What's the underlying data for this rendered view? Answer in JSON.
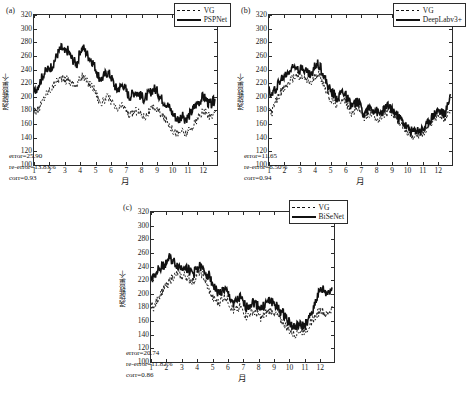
{
  "figure": {
    "background": "#ffffff",
    "series_color": "#111111"
  },
  "axis": {
    "xlabel": "月",
    "ylabel": "涡旋数量/个",
    "xticks": [
      "1",
      "2",
      "3",
      "4",
      "5",
      "6",
      "7",
      "8",
      "9",
      "10",
      "11",
      "12"
    ],
    "yticks": [
      "100",
      "120",
      "140",
      "160",
      "180",
      "200",
      "220",
      "240",
      "260",
      "280",
      "300",
      "320"
    ]
  },
  "panels": [
    {
      "tag": "(a)",
      "legend": [
        {
          "label": "VG",
          "style": "dashed"
        },
        {
          "label": "PSPNet",
          "style": "solid"
        }
      ],
      "stats": {
        "error": "error=25.90",
        "re_error": "re-error=13.83%",
        "corr": "corr=0.93"
      }
    },
    {
      "tag": "(b)",
      "legend": [
        {
          "label": "VG",
          "style": "dashed"
        },
        {
          "label": "DeepLabv3+",
          "style": "solid"
        }
      ],
      "stats": {
        "error": "error=11.65",
        "re_error": "re-error=6.50%",
        "corr": "corr=0.94"
      }
    },
    {
      "tag": "(c)",
      "legend": [
        {
          "label": "VG",
          "style": "dashed"
        },
        {
          "label": "BiSeNet",
          "style": "solid"
        }
      ],
      "stats": {
        "error": "error=20.74",
        "re_error": "re-error=11.82%",
        "corr": "corr=0.86"
      }
    }
  ],
  "chart_data": {
    "type": "line",
    "title": "",
    "xlabel": "月",
    "ylabel": "涡旋数量/个",
    "xlim": [
      1,
      12.9
    ],
    "ylim": [
      100,
      320
    ],
    "grid": false,
    "legend_position": "top-right",
    "panels": [
      {
        "tag": "(a)",
        "series": [
          {
            "name": "VG",
            "style": "dashed",
            "x": [
              1,
              1.2,
              1.4,
              1.6,
              1.8,
              2,
              2.2,
              2.4,
              2.6,
              2.8,
              3,
              3.2,
              3.4,
              3.6,
              3.8,
              4,
              4.2,
              4.4,
              4.6,
              4.8,
              5,
              5.2,
              5.4,
              5.6,
              5.8,
              6,
              6.2,
              6.4,
              6.6,
              6.8,
              7,
              7.2,
              7.4,
              7.6,
              7.8,
              8,
              8.2,
              8.4,
              8.6,
              8.8,
              9,
              9.2,
              9.4,
              9.6,
              9.8,
              10,
              10.2,
              10.4,
              10.6,
              10.8,
              11,
              11.2,
              11.4,
              11.6,
              11.8,
              12,
              12.2,
              12.4,
              12.6,
              12.8
            ],
            "values": [
              183,
              178,
              186,
              196,
              205,
              210,
              214,
              222,
              226,
              228,
              223,
              227,
              221,
              219,
              216,
              228,
              230,
              224,
              219,
              216,
              208,
              196,
              190,
              196,
              200,
              195,
              186,
              180,
              184,
              188,
              180,
              172,
              176,
              180,
              178,
              174,
              170,
              176,
              180,
              184,
              182,
              176,
              170,
              166,
              160,
              152,
              148,
              146,
              150,
              146,
              148,
              152,
              160,
              166,
              172,
              178,
              176,
              170,
              174,
              178
            ]
          },
          {
            "name": "PSPNet",
            "style": "solid",
            "x": [
              1,
              1.2,
              1.4,
              1.6,
              1.8,
              2,
              2.2,
              2.4,
              2.6,
              2.8,
              3,
              3.2,
              3.4,
              3.6,
              3.8,
              4,
              4.2,
              4.4,
              4.6,
              4.8,
              5,
              5.2,
              5.4,
              5.6,
              5.8,
              6,
              6.2,
              6.4,
              6.6,
              6.8,
              7,
              7.2,
              7.4,
              7.6,
              7.8,
              8,
              8.2,
              8.4,
              8.6,
              8.8,
              9,
              9.2,
              9.4,
              9.6,
              9.8,
              10,
              10.2,
              10.4,
              10.6,
              10.8,
              11,
              11.2,
              11.4,
              11.6,
              11.8,
              12,
              12.2,
              12.4,
              12.6,
              12.8
            ],
            "values": [
              206,
              214,
              222,
              232,
              238,
              241,
              246,
              256,
              266,
              272,
              264,
              268,
              258,
              252,
              248,
              268,
              272,
              264,
              258,
              252,
              242,
              230,
              226,
              232,
              236,
              230,
              218,
              210,
              214,
              218,
              208,
              200,
              204,
              208,
              204,
              200,
              196,
              202,
              208,
              212,
              208,
              200,
              194,
              190,
              184,
              176,
              170,
              166,
              172,
              168,
              170,
              176,
              184,
              190,
              194,
              200,
              196,
              188,
              192,
              196
            ]
          }
        ]
      },
      {
        "tag": "(b)",
        "series": [
          {
            "name": "VG",
            "style": "dashed",
            "x": [
              1,
              1.2,
              1.4,
              1.6,
              1.8,
              2,
              2.2,
              2.4,
              2.6,
              2.8,
              3,
              3.2,
              3.4,
              3.6,
              3.8,
              4,
              4.2,
              4.4,
              4.6,
              4.8,
              5,
              5.2,
              5.4,
              5.6,
              5.8,
              6,
              6.2,
              6.4,
              6.6,
              6.8,
              7,
              7.2,
              7.4,
              7.6,
              7.8,
              8,
              8.2,
              8.4,
              8.6,
              8.8,
              9,
              9.2,
              9.4,
              9.6,
              9.8,
              10,
              10.2,
              10.4,
              10.6,
              10.8,
              11,
              11.2,
              11.4,
              11.6,
              11.8,
              12,
              12.2,
              12.4,
              12.6,
              12.8
            ],
            "values": [
              183,
              178,
              190,
              200,
              208,
              212,
              218,
              224,
              228,
              232,
              226,
              230,
              224,
              222,
              220,
              232,
              234,
              228,
              216,
              206,
              196,
              192,
              188,
              194,
              198,
              192,
              182,
              176,
              180,
              184,
              176,
              168,
              172,
              176,
              174,
              170,
              166,
              172,
              176,
              178,
              176,
              170,
              164,
              160,
              154,
              148,
              144,
              142,
              146,
              144,
              146,
              150,
              158,
              164,
              170,
              174,
              172,
              168,
              172,
              176
            ]
          },
          {
            "name": "DeepLabv3+",
            "style": "solid",
            "x": [
              1,
              1.2,
              1.4,
              1.6,
              1.8,
              2,
              2.2,
              2.4,
              2.6,
              2.8,
              3,
              3.2,
              3.4,
              3.6,
              3.8,
              4,
              4.2,
              4.4,
              4.6,
              4.8,
              5,
              5.2,
              5.4,
              5.6,
              5.8,
              6,
              6.2,
              6.4,
              6.6,
              6.8,
              7,
              7.2,
              7.4,
              7.6,
              7.8,
              8,
              8.2,
              8.4,
              8.6,
              8.8,
              9,
              9.2,
              9.4,
              9.6,
              9.8,
              10,
              10.2,
              10.4,
              10.6,
              10.8,
              11,
              11.2,
              11.4,
              11.6,
              11.8,
              12,
              12.2,
              12.4,
              12.6,
              12.8
            ],
            "values": [
              208,
              202,
              212,
              220,
              226,
              230,
              236,
              240,
              244,
              248,
              240,
              244,
              238,
              234,
              232,
              246,
              250,
              242,
              228,
              218,
              208,
              204,
              198,
              204,
              208,
              202,
              192,
              186,
              190,
              194,
              184,
              176,
              180,
              184,
              182,
              178,
              174,
              180,
              184,
              186,
              182,
              176,
              170,
              166,
              160,
              154,
              150,
              148,
              152,
              150,
              152,
              156,
              164,
              170,
              176,
              180,
              178,
              174,
              186,
              204
            ]
          }
        ]
      },
      {
        "tag": "(c)",
        "series": [
          {
            "name": "VG",
            "style": "dashed",
            "x": [
              1,
              1.2,
              1.4,
              1.6,
              1.8,
              2,
              2.2,
              2.4,
              2.6,
              2.8,
              3,
              3.2,
              3.4,
              3.6,
              3.8,
              4,
              4.2,
              4.4,
              4.6,
              4.8,
              5,
              5.2,
              5.4,
              5.6,
              5.8,
              6,
              6.2,
              6.4,
              6.6,
              6.8,
              7,
              7.2,
              7.4,
              7.6,
              7.8,
              8,
              8.2,
              8.4,
              8.6,
              8.8,
              9,
              9.2,
              9.4,
              9.6,
              9.8,
              10,
              10.2,
              10.4,
              10.6,
              10.8,
              11,
              11.2,
              11.4,
              11.6,
              11.8,
              12,
              12.2,
              12.4,
              12.6,
              12.8
            ],
            "values": [
              184,
              180,
              190,
              200,
              206,
              212,
              218,
              224,
              228,
              230,
              224,
              228,
              222,
              220,
              218,
              230,
              232,
              226,
              214,
              204,
              194,
              190,
              186,
              192,
              196,
              190,
              180,
              174,
              178,
              182,
              174,
              166,
              170,
              174,
              172,
              168,
              164,
              170,
              174,
              176,
              174,
              168,
              162,
              158,
              152,
              146,
              142,
              140,
              146,
              144,
              146,
              150,
              158,
              164,
              170,
              176,
              174,
              168,
              174,
              180
            ]
          },
          {
            "name": "BiSeNet",
            "style": "solid",
            "x": [
              1,
              1.2,
              1.4,
              1.6,
              1.8,
              2,
              2.2,
              2.4,
              2.6,
              2.8,
              3,
              3.2,
              3.4,
              3.6,
              3.8,
              4,
              4.2,
              4.4,
              4.6,
              4.8,
              5,
              5.2,
              5.4,
              5.6,
              5.8,
              6,
              6.2,
              6.4,
              6.6,
              6.8,
              7,
              7.2,
              7.4,
              7.6,
              7.8,
              8,
              8.2,
              8.4,
              8.6,
              8.8,
              9,
              9.2,
              9.4,
              9.6,
              9.8,
              10,
              10.2,
              10.4,
              10.6,
              10.8,
              11,
              11.2,
              11.4,
              11.6,
              11.8,
              12,
              12.2,
              12.4,
              12.6,
              12.8
            ],
            "values": [
              220,
              228,
              234,
              238,
              242,
              246,
              252,
              248,
              244,
              240,
              238,
              242,
              236,
              232,
              230,
              238,
              240,
              234,
              230,
              226,
              216,
              206,
              200,
              204,
              206,
              200,
              192,
              186,
              190,
              194,
              186,
              180,
              184,
              188,
              186,
              182,
              178,
              184,
              188,
              190,
              186,
              180,
              174,
              170,
              166,
              158,
              152,
              150,
              154,
              152,
              154,
              158,
              170,
              182,
              196,
              204,
              206,
              200,
              204,
              208
            ]
          }
        ]
      }
    ]
  }
}
